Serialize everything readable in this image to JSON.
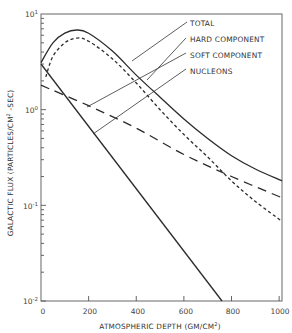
{
  "chart_data": {
    "type": "line",
    "title": "",
    "xlabel": "ATMOSPHERIC DEPTH (GM/CM²)",
    "ylabel": "GALACTIC FLUX (PARTICLES/CM² -SEC)",
    "xlim": [
      0,
      1030
    ],
    "ylim": [
      0.01,
      10
    ],
    "yscale": "log",
    "grid": false,
    "legend_position": "annotated-top-right",
    "x_ticks": [
      0,
      200,
      400,
      600,
      800,
      1000
    ],
    "x_tick_labels": [
      "0",
      "200",
      "400",
      "600",
      "800",
      "1000"
    ],
    "y_ticks": [
      10,
      1,
      0.1,
      0.01
    ],
    "y_tick_labels": [
      {
        "base": "10",
        "exp": "1"
      },
      {
        "base": "10",
        "exp": "0"
      },
      {
        "base": "10",
        "exp": "-1"
      },
      {
        "base": "10",
        "exp": "-2"
      }
    ],
    "series": [
      {
        "name": "TOTAL",
        "style": "solid",
        "x": [
          0,
          50,
          100,
          150,
          200,
          300,
          400,
          500,
          600,
          700,
          800,
          900,
          1030
        ],
        "values": [
          3.1,
          5.0,
          6.3,
          6.8,
          6.3,
          4.1,
          2.3,
          1.35,
          0.8,
          0.5,
          0.33,
          0.24,
          0.18
        ]
      },
      {
        "name": "HARD COMPONENT",
        "style": "short-dash",
        "x": [
          20,
          50,
          100,
          150,
          200,
          300,
          400,
          500,
          600,
          700,
          800,
          900,
          1030
        ],
        "values": [
          2.2,
          3.6,
          5.0,
          5.6,
          5.2,
          3.4,
          1.9,
          1.0,
          0.55,
          0.32,
          0.18,
          0.11,
          0.068
        ]
      },
      {
        "name": "SOFT COMPONENT",
        "style": "long-dash",
        "x": [
          0,
          200,
          400,
          600,
          800,
          1030
        ],
        "values": [
          1.8,
          1.1,
          0.64,
          0.34,
          0.2,
          0.12
        ]
      },
      {
        "name": "NUCLEONS",
        "style": "solid",
        "x": [
          0,
          760
        ],
        "values": [
          3.0,
          0.01
        ]
      }
    ],
    "annotations": [
      {
        "text": "TOTAL",
        "points_to_series": "TOTAL"
      },
      {
        "text": "HARD COMPONENT",
        "points_to_series": "HARD COMPONENT"
      },
      {
        "text": "SOFT COMPONENT",
        "points_to_series": "SOFT COMPONENT"
      },
      {
        "text": "NUCLEONS",
        "points_to_series": "NUCLEONS"
      }
    ]
  },
  "labels": {
    "xlabel_main": "ATMOSPHERIC DEPTH (GM/CM",
    "xlabel_sup": "2",
    "xlabel_end": ")",
    "ylabel_main": "GALACTIC FLUX (PARTICLES/CM",
    "ylabel_sup": "2",
    "ylabel_end": " -SEC)",
    "legend": [
      "TOTAL",
      "HARD COMPONENT",
      "SOFT COMPONENT",
      "NUCLEONS"
    ]
  },
  "colors": {
    "line": "#2b2b2b",
    "axis": "#555555",
    "text": "#333333",
    "background": "#ffffff"
  }
}
